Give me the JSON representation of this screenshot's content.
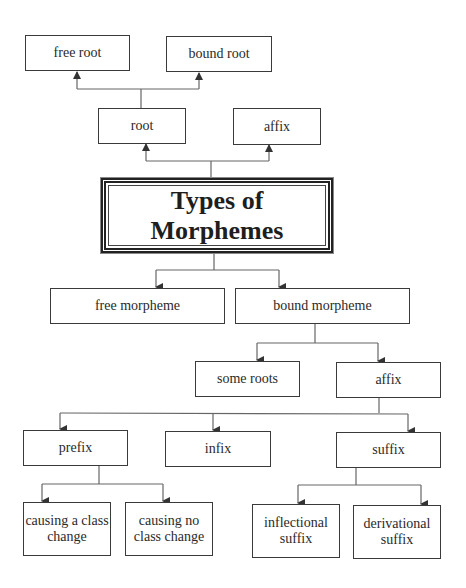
{
  "diagram": {
    "title": {
      "line1": "Types of",
      "line2": "Morphemes"
    },
    "nodes": {
      "free_root": "free root",
      "bound_root": "bound root",
      "root": "root",
      "affix_top": "affix",
      "free_morpheme": "free morpheme",
      "bound_morpheme": "bound morpheme",
      "some_roots": "some roots",
      "affix_mid": "affix",
      "prefix": "prefix",
      "infix": "infix",
      "suffix": "suffix",
      "causing_class_change": {
        "line1": "causing a class",
        "line2": "change"
      },
      "causing_no_class_change": {
        "line1": "causing no",
        "line2": "class change"
      },
      "inflectional_suffix": {
        "line1": "inflectional",
        "line2": "suffix"
      },
      "derivational_suffix": {
        "line1": "derivational",
        "line2": "suffix"
      }
    },
    "edges": [
      {
        "from": "Types of Morphemes",
        "to": "root"
      },
      {
        "from": "Types of Morphemes",
        "to": "affix"
      },
      {
        "from": "root",
        "to": "free root"
      },
      {
        "from": "root",
        "to": "bound root"
      },
      {
        "from": "Types of Morphemes",
        "to": "free morpheme"
      },
      {
        "from": "Types of Morphemes",
        "to": "bound morpheme"
      },
      {
        "from": "bound morpheme",
        "to": "some roots"
      },
      {
        "from": "bound morpheme",
        "to": "affix"
      },
      {
        "from": "affix",
        "to": "prefix"
      },
      {
        "from": "affix",
        "to": "infix"
      },
      {
        "from": "affix",
        "to": "suffix"
      },
      {
        "from": "prefix",
        "to": "causing a class change"
      },
      {
        "from": "prefix",
        "to": "causing no class change"
      },
      {
        "from": "suffix",
        "to": "inflectional suffix"
      },
      {
        "from": "suffix",
        "to": "derivational suffix"
      }
    ],
    "colors": {
      "line": "#555555",
      "border": "#3a3a3a",
      "text": "#2a2a2a"
    }
  }
}
